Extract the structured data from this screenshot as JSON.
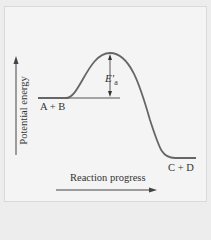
{
  "diagram": {
    "type": "energy-profile",
    "y_axis_label": "Potential energy",
    "x_axis_label": "Reaction progress",
    "reactants_label": "A + B",
    "products_label": "C + D",
    "activation_energy_symbol": "E",
    "activation_energy_prime": "′",
    "activation_energy_subscript": "a",
    "colors": {
      "background": "#f4f4f4",
      "curve": "#555555",
      "text": "#333333"
    }
  }
}
